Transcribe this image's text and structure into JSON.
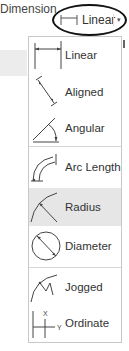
{
  "panel": {
    "title": "Dimension"
  },
  "dropdown": {
    "selected_label": "Linear",
    "selected_icon": "linear-dimension-icon",
    "caret": "▾",
    "highlighted_by_annotation": true
  },
  "menu": {
    "items": [
      {
        "label": "Linear",
        "icon": "linear-dimension-icon",
        "selected": false
      },
      {
        "label": "Aligned",
        "icon": "aligned-dimension-icon",
        "selected": false
      },
      {
        "label": "Angular",
        "icon": "angular-dimension-icon",
        "selected": false
      },
      {
        "label": "Arc Length",
        "icon": "arc-length-dimension-icon",
        "selected": false
      },
      {
        "label": "Radius",
        "icon": "radius-dimension-icon",
        "selected": true
      },
      {
        "label": "Diameter",
        "icon": "diameter-dimension-icon",
        "selected": false
      },
      {
        "label": "Jogged",
        "icon": "jogged-dimension-icon",
        "selected": false
      },
      {
        "label": "Ordinate",
        "icon": "ordinate-dimension-icon",
        "selected": false
      }
    ],
    "ordinate_axis_labels": {
      "x": "X",
      "y": "Y"
    },
    "highlight_color": "#e6e6e6",
    "border_color": "#c8c8c8"
  }
}
